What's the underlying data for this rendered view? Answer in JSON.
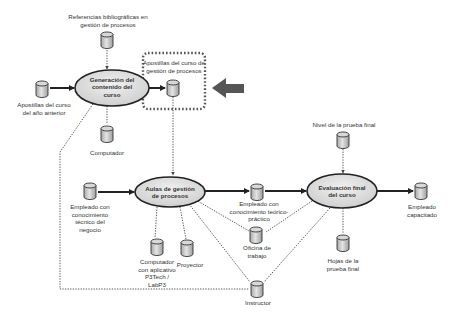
{
  "processes": {
    "generation": {
      "label": "Generación del\ncontenido del\ncurso"
    },
    "classroom": {
      "label": "Aulas de gestión\nde procesos"
    },
    "evaluation": {
      "label": "Evaluación final\ndel curso"
    }
  },
  "resources": {
    "references": {
      "label": "Referencias bibliográficas en\ngestión de procesos"
    },
    "previous_notes": {
      "label": "Apostillas del curso\ndel año  anterior"
    },
    "computer": {
      "label": "Computador"
    },
    "course_notes": {
      "label": "Apostillas del curso de\ngestión de procesos"
    },
    "employee_technical": {
      "label": "Empleado con\nconocimiento\ntécnico del\nnegocio"
    },
    "computer_app": {
      "label": "Computador\ncon aplicativo\nP3Tech /\nLabP3"
    },
    "projector": {
      "label": "Proyector"
    },
    "employee_theory": {
      "label": "Empleado con\nconocimiento teórico-\npráctico"
    },
    "office": {
      "label": "Oficina de\ntrabajo"
    },
    "instructor": {
      "label": "Instructor"
    },
    "final_test_level": {
      "label": "Nivel de la prueba final"
    },
    "final_test_sheets": {
      "label": "Hojas de la\nprueba final"
    },
    "trained_employee": {
      "label": "Empleado\ncapacitado"
    }
  },
  "highlight": {
    "arrow": "left-arrow-icon",
    "box_style": "dotted"
  },
  "colors": {
    "ellipse_fill": "#d9d9d9",
    "cylinder_fill": "#c8c8c8",
    "stroke": "#222222",
    "arrow_fill": "#555555",
    "dotted": "#555555"
  }
}
